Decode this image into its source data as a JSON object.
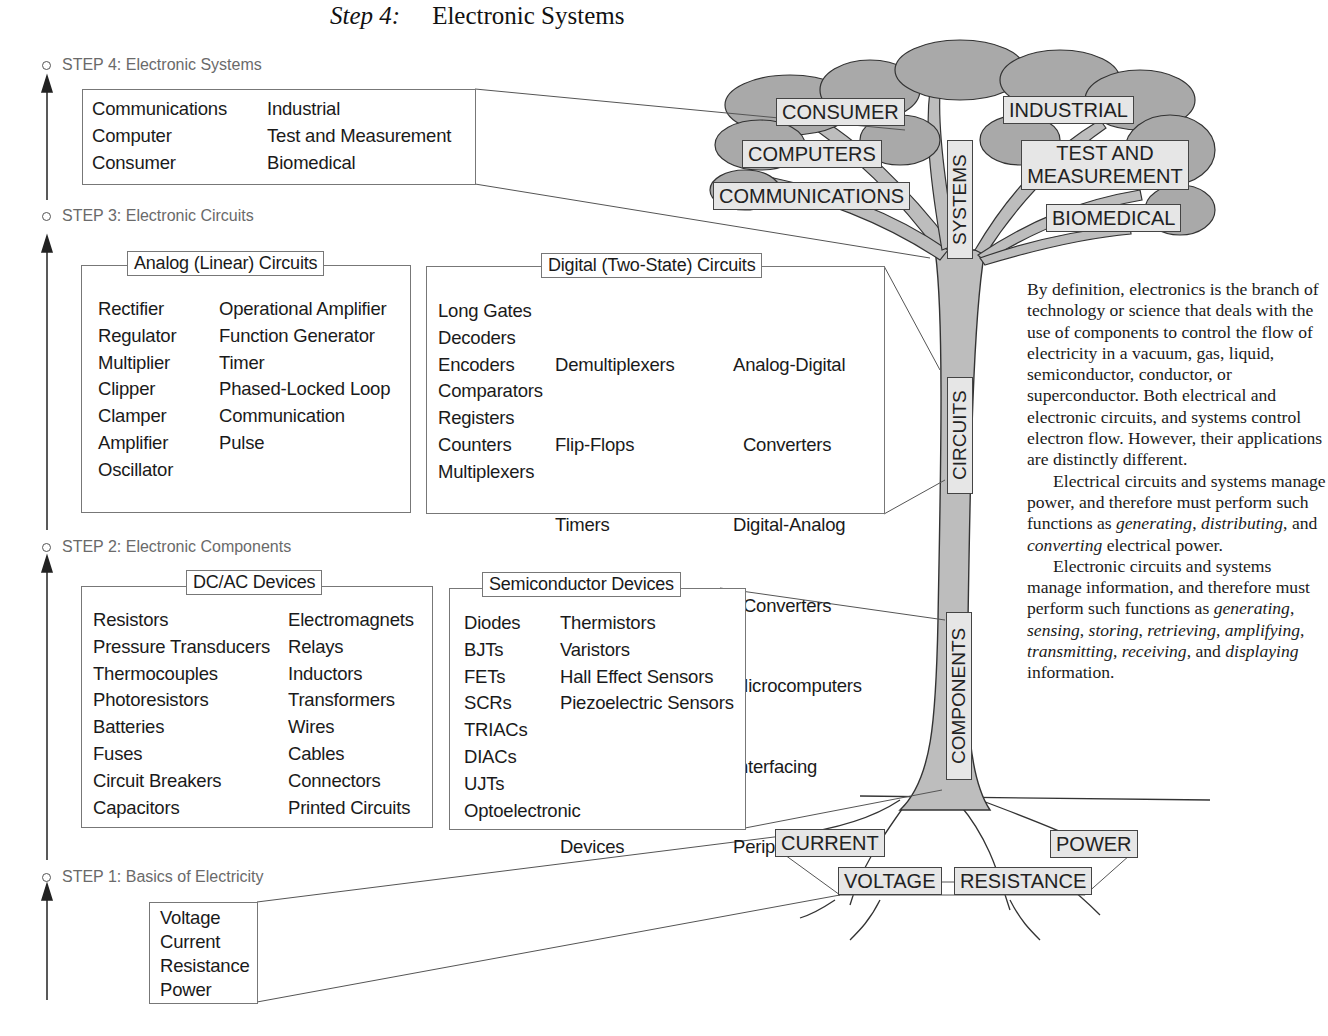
{
  "title": {
    "step": "Step 4:",
    "text": "Electronic Systems"
  },
  "steps": [
    {
      "label": "STEP 4: Electronic Systems"
    },
    {
      "label": "STEP 3: Electronic Circuits"
    },
    {
      "label": "STEP 2: Electronic Components"
    },
    {
      "label": "STEP 1: Basics of Electricity"
    }
  ],
  "systems_box": {
    "col1": [
      "Communications",
      "Computer",
      "Consumer"
    ],
    "col2": [
      "Industrial",
      "Test and Measurement",
      "Biomedical"
    ]
  },
  "analog_box": {
    "title": "Analog (Linear) Circuits",
    "col1": [
      "Rectifier",
      "Regulator",
      "Multiplier",
      "Clipper",
      "Clamper",
      "Amplifier",
      "Oscillator"
    ],
    "col2": [
      "Operational Amplifier",
      "Function Generator",
      "Timer",
      "Phased-Locked Loop",
      "Communication",
      "Pulse"
    ]
  },
  "digital_box": {
    "title": "Digital (Two-State) Circuits",
    "col1": [
      "Long Gates",
      "Decoders",
      "Encoders",
      "Comparators",
      "Registers",
      "Counters",
      "Multiplexers"
    ],
    "col2": [
      "Demultiplexers",
      "Flip-Flops",
      "Timers",
      "Arithmetic Circuits",
      "Memory Circuits",
      "Programmable Logic",
      " Devices"
    ],
    "col3": [
      "Analog-Digital",
      "  Converters",
      "Digital-Analog",
      "  Converters",
      "Microcomputers",
      "Interfacing",
      "Peripherals"
    ]
  },
  "dcac_box": {
    "title": "DC/AC Devices",
    "col1": [
      "Resistors",
      "Pressure Transducers",
      "Thermocouples",
      "Photoresistors",
      "Batteries",
      "Fuses",
      "Circuit Breakers",
      "Capacitors"
    ],
    "col2": [
      "Electromagnets",
      "Relays",
      "Inductors",
      "Transformers",
      "Wires",
      "Cables",
      "Connectors",
      "Printed Circuits"
    ]
  },
  "semi_box": {
    "title": "Semiconductor Devices",
    "col1": [
      "Diodes",
      "BJTs",
      "FETs",
      "SCRs",
      "TRIACs",
      "DIACs",
      "UJTs",
      "Optoelectronic"
    ],
    "col2": [
      "Thermistors",
      "Varistors",
      "Hall Effect Sensors",
      "Piezoelectric Sensors"
    ]
  },
  "basics_box": {
    "items": [
      "Voltage",
      "Current",
      "Resistance",
      "Power"
    ]
  },
  "tree": {
    "canopy_labels": {
      "consumer": "CONSUMER",
      "computers": "COMPUTERS",
      "communications": "COMMUNICATIONS",
      "industrial": "INDUSTRIAL",
      "test1": "TEST AND",
      "test2": "MEASUREMENT",
      "biomedical": "BIOMEDICAL"
    },
    "trunk_labels": {
      "systems": "SYSTEMS",
      "circuits": "CIRCUITS",
      "components": "COMPONENTS"
    },
    "root_labels": {
      "current": "CURRENT",
      "power": "POWER",
      "voltage": "VOLTAGE",
      "resistance": "RESISTANCE"
    },
    "colors": {
      "foliage": "#a9a9a9",
      "trunk": "#bdbdbd",
      "outline": "#333333",
      "label_bg": "#e6e6e6"
    }
  },
  "paragraph": {
    "p1": "By definition, electronics is the branch of technology or science that deals with the use of components to control the flow of electricity in a vacuum, gas, liquid, semiconductor, conductor, or superconductor.  Both electrical and electronic circuits, and systems control electron flow. However, their applications are distinctly different.",
    "p2_a": "Electrical circuits and systems manage power, and therefore must perform such functions as ",
    "p2_i1": "generating",
    "p2_b": ", ",
    "p2_i2": "distributing",
    "p2_c": ", and ",
    "p2_i3": "converting",
    "p2_d": " electrical power.",
    "p3_a": "Electronic circuits and systems manage information, and therefore must perform such functions as ",
    "p3_i1": "generating",
    "p3_s1": ", ",
    "p3_i2": "sensing",
    "p3_s2": ", ",
    "p3_i3": "storing",
    "p3_s3": ", ",
    "p3_i4": "retrieving",
    "p3_s4": ", ",
    "p3_i5": "amplifying",
    "p3_s5": ", ",
    "p3_i6": "transmitting",
    "p3_s6": ", ",
    "p3_i7": "receiving",
    "p3_s7": ", and ",
    "p3_i8": "displaying",
    "p3_end": " information."
  }
}
